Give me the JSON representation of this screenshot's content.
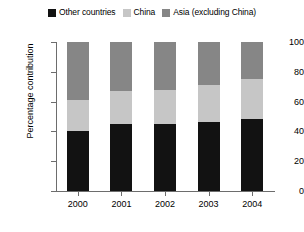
{
  "chart_data": {
    "type": "bar",
    "stacked": true,
    "stack_total": 100,
    "title": "",
    "subtitle": "",
    "xlabel": "",
    "ylabel": "Percentage contribution",
    "categories": [
      "2000",
      "2001",
      "2002",
      "2003",
      "2004"
    ],
    "ylim": [
      0,
      100
    ],
    "yticks": [
      0,
      20,
      40,
      60,
      80,
      100
    ],
    "ytick_labels": [
      "0",
      "20",
      "40",
      "60",
      "80",
      "100"
    ],
    "grid": false,
    "legend_position": "top-center",
    "series": [
      {
        "name": "Other countries",
        "color": "#121212",
        "values": [
          40,
          45,
          45,
          46,
          48
        ]
      },
      {
        "name": "China",
        "color": "#c6c6c6",
        "values": [
          21,
          22,
          23,
          25,
          27
        ]
      },
      {
        "name": "Asia (excluding China)",
        "color": "#868686",
        "values": [
          39,
          33,
          32,
          29,
          25
        ]
      }
    ],
    "annotations": []
  },
  "legend": {
    "items": [
      {
        "label": "Other countries",
        "swatch": "legend-swatch-other-countries"
      },
      {
        "label": "China",
        "swatch": "legend-swatch-china"
      },
      {
        "label": "Asia (excluding China)",
        "swatch": "legend-swatch-asia"
      }
    ]
  },
  "colors": {
    "other_countries": "#121212",
    "china": "#c6c6c6",
    "asia_excluding_china": "#868686",
    "axis": "#6d6d6d",
    "background": "#ffffff",
    "text": "#000000"
  }
}
